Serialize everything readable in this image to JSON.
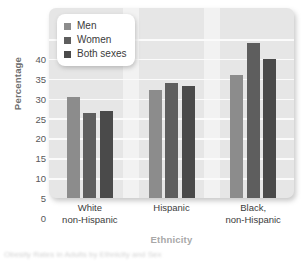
{
  "chart_data": {
    "type": "bar",
    "title": "",
    "subtitle": "",
    "xlabel": "Ethnicity",
    "ylabel": "Percentage",
    "categories": [
      "White non-Hispanic",
      "Hispanic",
      "Black, non-Hispanic"
    ],
    "category_lines": [
      [
        "White",
        "non-Hispanic"
      ],
      [
        "Hispanic",
        ""
      ],
      [
        "Black,",
        "non-Hispanic"
      ]
    ],
    "series": [
      {
        "name": "Men",
        "values": [
          25.5,
          27.2,
          31.0
        ],
        "color": "#8c8c8c"
      },
      {
        "name": "Women",
        "values": [
          21.3,
          29.0,
          39.0
        ],
        "color": "#5e5e5e"
      },
      {
        "name": "Both sexes",
        "values": [
          22.0,
          28.2,
          35.0
        ],
        "color": "#4a4a4a"
      }
    ],
    "ylim": [
      0,
      41.5
    ],
    "yticks": [
      0,
      5,
      10,
      15,
      20,
      25,
      30,
      35,
      40
    ],
    "ytick_labels": [
      "0",
      "5",
      "10",
      "15",
      "20",
      "25",
      "30",
      "35",
      "40"
    ],
    "grid": "horizontal",
    "legend_position": "top-left-inside",
    "panel_color": "#e6e6e6",
    "gridline_color": "#fbfbfb"
  },
  "legend": {
    "entries": [
      {
        "label": "Men"
      },
      {
        "label": "Women"
      },
      {
        "label": "Both sexes"
      }
    ]
  },
  "caption": {
    "text": "Obesity Rates in Adults by Ethnicity and Sex"
  }
}
